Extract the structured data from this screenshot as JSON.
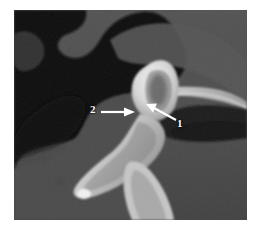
{
  "figure": {
    "kind": "radiograph",
    "modality": "cbct-sagittal-slice",
    "canvas": {
      "width": 254,
      "height": 232,
      "background": "#ffffff"
    },
    "viewport": {
      "x": 14,
      "y": 10,
      "width": 233,
      "height": 210
    }
  },
  "palette": {
    "air_black": "#0e0e0e",
    "air_dark": "#1a1a1a",
    "soft_tissue_dark": "#3c3c3c",
    "soft_tissue_mid": "#4a4a4a",
    "soft_tissue_light": "#5c5c5c",
    "bone_gray": "#6e6e6e",
    "bone_bright": "#b9b9b9",
    "enamel_white": "#eeeeee",
    "annotation_white": "#ffffff",
    "border_white": "#ffffff"
  },
  "annotations": [
    {
      "id": "annotation-1",
      "label": "1",
      "label_x": 178,
      "label_y": 125,
      "arrow": {
        "tail_x": 174,
        "tail_y": 118,
        "head_x": 147,
        "head_y": 104
      },
      "direction": "up-left"
    },
    {
      "id": "annotation-2",
      "label": "2",
      "label_x": 94,
      "label_y": 116,
      "arrow": {
        "tail_x": 101,
        "tail_y": 112,
        "head_x": 133,
        "head_y": 112
      },
      "direction": "right"
    }
  ],
  "structures": [
    {
      "name": "air-space-upper-left",
      "tone": "air_black"
    },
    {
      "name": "scalloped-tissue-boundary",
      "tone": "soft_tissue_mid"
    },
    {
      "name": "tooth-crown-radiopaque",
      "tone": "enamel_white"
    },
    {
      "name": "tooth-root-blade",
      "tone": "bone_bright"
    },
    {
      "name": "adjacent-tooth-lower",
      "tone": "bone_bright"
    },
    {
      "name": "cortical-bone-band",
      "tone": "bone_bright"
    },
    {
      "name": "air-space-lower-right",
      "tone": "air_dark"
    }
  ]
}
